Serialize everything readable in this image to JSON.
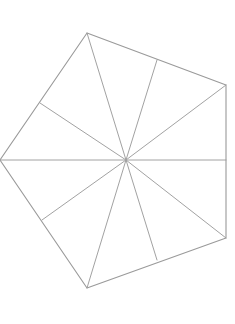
{
  "figure": {
    "type": "line-drawing",
    "canvas": {
      "width": 235,
      "height": 324,
      "background_color": "#ffffff"
    },
    "style": {
      "outline_color": "#9a9a9a",
      "outline_width": 1.1,
      "spoke_color": "#a2a2a2",
      "spoke_width": 1.0
    },
    "center": {
      "x": 126,
      "y": 160,
      "label": "center"
    },
    "vertices": [
      {
        "name": "top",
        "x": 87,
        "y": 33
      },
      {
        "name": "upper-right",
        "x": 226,
        "y": 85
      },
      {
        "name": "lower-right",
        "x": 226,
        "y": 238
      },
      {
        "name": "bottom",
        "x": 87,
        "y": 288
      },
      {
        "name": "left",
        "x": 0,
        "y": 160
      }
    ],
    "edge_points": [
      {
        "name": "upper-right-edge",
        "x": 157,
        "y": 60
      },
      {
        "name": "right-edge",
        "x": 226,
        "y": 160
      },
      {
        "name": "lower-right-edge",
        "x": 157,
        "y": 260
      },
      {
        "name": "lower-left-edge",
        "x": 42,
        "y": 220
      },
      {
        "name": "upper-left-edge",
        "x": 40,
        "y": 103
      }
    ],
    "outline_points": "87,33 226,85 226,238 87,288 0,160",
    "spokes": [
      {
        "name": "spoke-to-top",
        "x": 87,
        "y": 33
      },
      {
        "name": "spoke-to-upper-right-edge",
        "x": 157,
        "y": 60
      },
      {
        "name": "spoke-to-upper-right",
        "x": 226,
        "y": 85
      },
      {
        "name": "spoke-to-right-edge",
        "x": 226,
        "y": 160
      },
      {
        "name": "spoke-to-lower-right",
        "x": 226,
        "y": 238
      },
      {
        "name": "spoke-to-lower-right-edge",
        "x": 157,
        "y": 260
      },
      {
        "name": "spoke-to-bottom",
        "x": 87,
        "y": 288
      },
      {
        "name": "spoke-to-lower-left-edge",
        "x": 42,
        "y": 220
      },
      {
        "name": "spoke-to-left",
        "x": 0,
        "y": 160
      },
      {
        "name": "spoke-to-upper-left-edge",
        "x": 40,
        "y": 103
      }
    ]
  }
}
